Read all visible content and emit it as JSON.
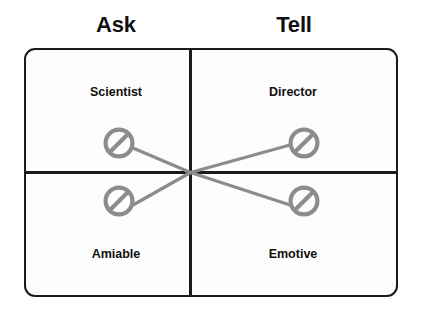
{
  "diagram": {
    "type": "2x2-matrix",
    "axis": {
      "column_headers": [
        {
          "id": "ask",
          "label": "Ask"
        },
        {
          "id": "tell",
          "label": "Tell"
        }
      ]
    },
    "quadrants": [
      {
        "id": "scientist",
        "label": "Scientist",
        "column": "ask",
        "row": "top",
        "icon": "no-entry-icon"
      },
      {
        "id": "director",
        "label": "Director",
        "column": "tell",
        "row": "top",
        "icon": "no-entry-icon"
      },
      {
        "id": "amiable",
        "label": "Amiable",
        "column": "ask",
        "row": "bottom",
        "icon": "no-entry-icon"
      },
      {
        "id": "emotive",
        "label": "Emotive",
        "column": "tell",
        "row": "bottom",
        "icon": "no-entry-icon"
      }
    ],
    "connectors": [
      {
        "id": "scientist-to-emotive",
        "from": "scientist",
        "to": "emotive"
      },
      {
        "id": "amiable-to-director",
        "from": "amiable",
        "to": "director"
      }
    ],
    "colors": {
      "frame_border": "#1b1b1b",
      "divider": "#1b1b1b",
      "icon_gray": "#8c8c8c",
      "connector_gray": "#8c8c8c",
      "text": "#111111",
      "background": "#ffffff",
      "panel_background": "#fdfdfd"
    }
  }
}
